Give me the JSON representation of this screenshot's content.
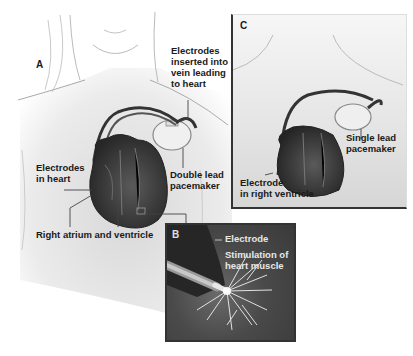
{
  "figure": {
    "panels": [
      {
        "id": "A",
        "letter": "A",
        "description": "Double lead pacemaker in chest with electrodes in heart",
        "labels": {
          "electrodes_vein": "Electrodes\ninserted into\nvein leading\nto heart",
          "electrodes_heart": "Electrodes\nin heart",
          "double_lead": "Double lead\npacemaker",
          "right_atrium": "Right atrium and ventricle"
        }
      },
      {
        "id": "B",
        "letter": "B",
        "description": "Close-up of electrode stimulating heart muscle",
        "labels": {
          "electrode": "Electrode",
          "stimulation": "Stimulation of\nheart muscle"
        }
      },
      {
        "id": "C",
        "letter": "C",
        "description": "Single lead pacemaker with electrode in right ventricle",
        "labels": {
          "single_lead": "Single lead\npacemaker",
          "electrode_rv": "Electrode\nin right ventricle"
        }
      }
    ],
    "colors": {
      "background": "#ffffff",
      "skin": "#e6e6e6",
      "heart_dark": "#2e2e2e",
      "heart_mid": "#555555",
      "lead": "#3a3a3a",
      "panel_border": "#333333",
      "callout": "#444444"
    }
  }
}
